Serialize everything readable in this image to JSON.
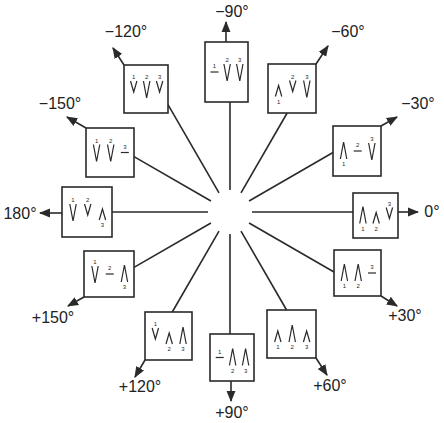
{
  "diagram": {
    "title": "",
    "center": {
      "x": 230,
      "y": 212
    },
    "line_color": "#2a2a2a",
    "angles": [
      {
        "id": "m90",
        "label": "−90°",
        "angle": -90,
        "box": {
          "x": 205,
          "y": 42,
          "w": 43,
          "h": 60
        },
        "arrow": {
          "x1": 226,
          "y1": 42,
          "x2": 226,
          "y2": 22
        },
        "label_pos": {
          "x": 232,
          "y": 12
        },
        "peaks": [
          {
            "n": "1",
            "type": "flat"
          },
          {
            "n": "2",
            "type": "down"
          },
          {
            "n": "3",
            "type": "down"
          }
        ]
      },
      {
        "id": "m60",
        "label": "−60°",
        "angle": -60,
        "box": {
          "x": 268,
          "y": 64,
          "w": 48,
          "h": 49
        },
        "arrow": {
          "x1": 316,
          "y1": 64,
          "x2": 328,
          "y2": 46
        },
        "label_pos": {
          "x": 348,
          "y": 32
        },
        "peaks": [
          {
            "n": "1",
            "type": "up-small"
          },
          {
            "n": "2",
            "type": "down-small"
          },
          {
            "n": "3",
            "type": "down"
          }
        ]
      },
      {
        "id": "m30",
        "label": "−30°",
        "angle": -30,
        "box": {
          "x": 333,
          "y": 126,
          "w": 48,
          "h": 50
        },
        "arrow": {
          "x1": 381,
          "y1": 126,
          "x2": 397,
          "y2": 117
        },
        "label_pos": {
          "x": 418,
          "y": 104
        },
        "peaks": [
          {
            "n": "1",
            "type": "up"
          },
          {
            "n": "2",
            "type": "flat"
          },
          {
            "n": "3",
            "type": "down"
          }
        ]
      },
      {
        "id": "p0",
        "label": "0°",
        "angle": 0,
        "box": {
          "x": 353,
          "y": 193,
          "w": 45,
          "h": 45
        },
        "arrow": {
          "x1": 398,
          "y1": 212,
          "x2": 418,
          "y2": 212
        },
        "label_pos": {
          "x": 432,
          "y": 212
        },
        "peaks": [
          {
            "n": "1",
            "type": "up"
          },
          {
            "n": "2",
            "type": "up-small"
          },
          {
            "n": "3",
            "type": "down-small"
          }
        ]
      },
      {
        "id": "p30",
        "label": "+30°",
        "angle": 30,
        "box": {
          "x": 334,
          "y": 250,
          "w": 47,
          "h": 46
        },
        "arrow": {
          "x1": 381,
          "y1": 296,
          "x2": 397,
          "y2": 306
        },
        "label_pos": {
          "x": 405,
          "y": 316
        },
        "peaks": [
          {
            "n": "1",
            "type": "up"
          },
          {
            "n": "2",
            "type": "up"
          },
          {
            "n": "3",
            "type": "flat"
          }
        ]
      },
      {
        "id": "p60",
        "label": "+60°",
        "angle": 60,
        "box": {
          "x": 267,
          "y": 310,
          "w": 49,
          "h": 48
        },
        "arrow": {
          "x1": 316,
          "y1": 358,
          "x2": 327,
          "y2": 375
        },
        "label_pos": {
          "x": 330,
          "y": 386
        },
        "peaks": [
          {
            "n": "1",
            "type": "up-small"
          },
          {
            "n": "2",
            "type": "up"
          },
          {
            "n": "3",
            "type": "up-small"
          }
        ]
      },
      {
        "id": "p90",
        "label": "+90°",
        "angle": 90,
        "box": {
          "x": 210,
          "y": 334,
          "w": 44,
          "h": 47
        },
        "arrow": {
          "x1": 231,
          "y1": 381,
          "x2": 231,
          "y2": 401
        },
        "label_pos": {
          "x": 232,
          "y": 413
        },
        "peaks": [
          {
            "n": "1",
            "type": "flat"
          },
          {
            "n": "2",
            "type": "up"
          },
          {
            "n": "3",
            "type": "up"
          }
        ]
      },
      {
        "id": "p120",
        "label": "+120°",
        "angle": 120,
        "box": {
          "x": 145,
          "y": 312,
          "w": 47,
          "h": 48
        },
        "arrow": {
          "x1": 145,
          "y1": 360,
          "x2": 135,
          "y2": 377
        },
        "label_pos": {
          "x": 140,
          "y": 387
        },
        "peaks": [
          {
            "n": "1",
            "type": "down-small"
          },
          {
            "n": "2",
            "type": "up-small"
          },
          {
            "n": "3",
            "type": "up"
          }
        ]
      },
      {
        "id": "p150",
        "label": "+150°",
        "angle": 150,
        "box": {
          "x": 84,
          "y": 251,
          "w": 50,
          "h": 46
        },
        "arrow": {
          "x1": 84,
          "y1": 297,
          "x2": 68,
          "y2": 306
        },
        "label_pos": {
          "x": 53,
          "y": 318
        },
        "peaks": [
          {
            "n": "1",
            "type": "down"
          },
          {
            "n": "2",
            "type": "flat"
          },
          {
            "n": "3",
            "type": "up"
          }
        ]
      },
      {
        "id": "p180",
        "label": "180°",
        "angle": 180,
        "box": {
          "x": 62,
          "y": 187,
          "w": 50,
          "h": 50
        },
        "arrow": {
          "x1": 62,
          "y1": 213,
          "x2": 40,
          "y2": 213
        },
        "label_pos": {
          "x": 20,
          "y": 214
        },
        "peaks": [
          {
            "n": "1",
            "type": "down"
          },
          {
            "n": "2",
            "type": "down-small"
          },
          {
            "n": "3",
            "type": "up-small"
          }
        ]
      },
      {
        "id": "m150",
        "label": "−150°",
        "angle": -150,
        "box": {
          "x": 86,
          "y": 128,
          "w": 48,
          "h": 49
        },
        "arrow": {
          "x1": 86,
          "y1": 128,
          "x2": 67,
          "y2": 117
        },
        "label_pos": {
          "x": 60,
          "y": 104
        },
        "peaks": [
          {
            "n": "1",
            "type": "down"
          },
          {
            "n": "2",
            "type": "down"
          },
          {
            "n": "3",
            "type": "flat"
          }
        ]
      },
      {
        "id": "m120",
        "label": "−120°",
        "angle": -120,
        "box": {
          "x": 124,
          "y": 65,
          "w": 44,
          "h": 48
        },
        "arrow": {
          "x1": 124,
          "y1": 65,
          "x2": 113,
          "y2": 48
        },
        "label_pos": {
          "x": 126,
          "y": 32
        },
        "peaks": [
          {
            "n": "1",
            "type": "down-small"
          },
          {
            "n": "2",
            "type": "down"
          },
          {
            "n": "3",
            "type": "down-small"
          }
        ]
      }
    ]
  }
}
